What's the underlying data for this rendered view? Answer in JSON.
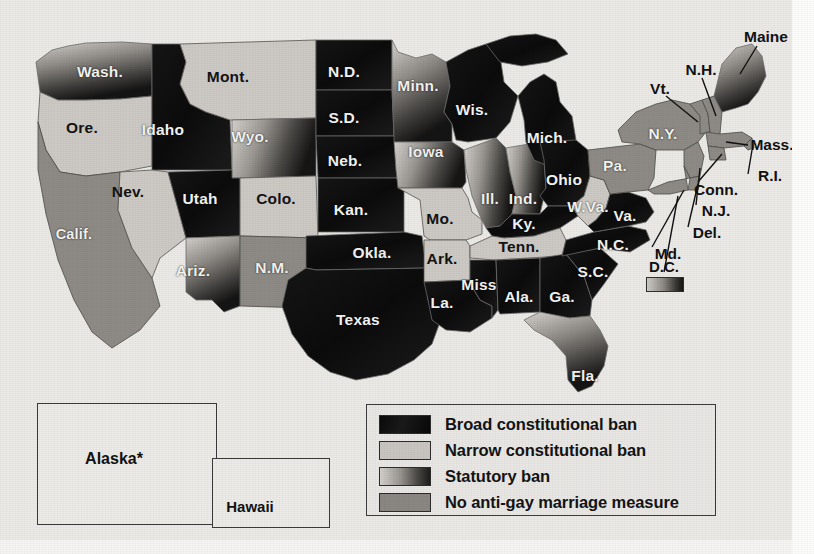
{
  "figure": {
    "kind": "choropleth-map"
  },
  "background_color": "#eceae7",
  "categories": [
    {
      "key": "broad",
      "label": "Broad constitutional ban",
      "swatch": "#0d0d0d",
      "style": "solid-dark"
    },
    {
      "key": "narrow",
      "label": "Narrow constitutional ban",
      "swatch": "#cdcac5",
      "style": "solid-light"
    },
    {
      "key": "stat",
      "label": "Statutory ban",
      "swatch": "#9a9792",
      "style": "gradient"
    },
    {
      "key": "none",
      "label": "No anti-gay marriage measure",
      "swatch": "#8e8b86",
      "style": "solid-medium"
    }
  ],
  "legend": {
    "name": "map-legend",
    "items": [
      "Broad constitutional ban",
      "Narrow constitutional ban",
      "Statutory ban",
      "No anti-gay marriage measure"
    ]
  },
  "insets": [
    {
      "name": "alaska-inset",
      "label": "Alaska*",
      "category": "none"
    },
    {
      "name": "hawaii-inset",
      "label": "Hawaii",
      "category": "broad"
    }
  ],
  "dc": {
    "label": "D.C.",
    "category": "stat"
  },
  "states": [
    {
      "abbr": "Wash.",
      "category": "stat",
      "x": 100,
      "y": 72,
      "tone": "lt"
    },
    {
      "abbr": "Ore.",
      "category": "narrow",
      "x": 82,
      "y": 128,
      "tone": "dk"
    },
    {
      "abbr": "Calif.",
      "category": "none",
      "x": 74,
      "y": 234,
      "tone": "lt"
    },
    {
      "abbr": "Idaho",
      "category": "broad",
      "x": 163,
      "y": 130,
      "tone": "lt"
    },
    {
      "abbr": "Nev.",
      "category": "narrow",
      "x": 128,
      "y": 192,
      "tone": "dk"
    },
    {
      "abbr": "Mont.",
      "category": "narrow",
      "x": 228,
      "y": 77,
      "tone": "dk"
    },
    {
      "abbr": "Wyo.",
      "category": "stat",
      "x": 250,
      "y": 137,
      "tone": "lt"
    },
    {
      "abbr": "Utah",
      "category": "broad",
      "x": 200,
      "y": 199,
      "tone": "lt"
    },
    {
      "abbr": "Colo.",
      "category": "narrow",
      "x": 276,
      "y": 199,
      "tone": "dk"
    },
    {
      "abbr": "Ariz.",
      "category": "stat",
      "x": 193,
      "y": 271,
      "tone": "lt"
    },
    {
      "abbr": "N.M.",
      "category": "none",
      "x": 272,
      "y": 268,
      "tone": "lt"
    },
    {
      "abbr": "N.D.",
      "category": "broad",
      "x": 344,
      "y": 72,
      "tone": "lt"
    },
    {
      "abbr": "S.D.",
      "category": "broad",
      "x": 344,
      "y": 118,
      "tone": "lt"
    },
    {
      "abbr": "Neb.",
      "category": "broad",
      "x": 345,
      "y": 161,
      "tone": "lt"
    },
    {
      "abbr": "Kan.",
      "category": "broad",
      "x": 351,
      "y": 210,
      "tone": "lt"
    },
    {
      "abbr": "Okla.",
      "category": "broad",
      "x": 372,
      "y": 253,
      "tone": "lt"
    },
    {
      "abbr": "Texas",
      "category": "broad",
      "x": 358,
      "y": 320,
      "tone": "lt"
    },
    {
      "abbr": "Minn.",
      "category": "stat",
      "x": 418,
      "y": 86,
      "tone": "lt"
    },
    {
      "abbr": "Iowa",
      "category": "stat",
      "x": 426,
      "y": 152,
      "tone": "lt"
    },
    {
      "abbr": "Mo.",
      "category": "narrow",
      "x": 440,
      "y": 219,
      "tone": "dk"
    },
    {
      "abbr": "Ark.",
      "category": "narrow",
      "x": 442,
      "y": 259,
      "tone": "dk"
    },
    {
      "abbr": "La.",
      "category": "broad",
      "x": 442,
      "y": 303,
      "tone": "lt"
    },
    {
      "abbr": "Wis.",
      "category": "broad",
      "x": 472,
      "y": 110,
      "tone": "lt"
    },
    {
      "abbr": "Ill.",
      "category": "stat",
      "x": 490,
      "y": 199,
      "tone": "lt"
    },
    {
      "abbr": "Ind.",
      "category": "stat",
      "x": 523,
      "y": 199,
      "tone": "lt"
    },
    {
      "abbr": "Mich.",
      "category": "broad",
      "x": 547,
      "y": 138,
      "tone": "lt"
    },
    {
      "abbr": "Ohio",
      "category": "broad",
      "x": 564,
      "y": 180,
      "tone": "lt"
    },
    {
      "abbr": "Ky.",
      "category": "broad",
      "x": 524,
      "y": 224,
      "tone": "lt"
    },
    {
      "abbr": "Tenn.",
      "category": "narrow",
      "x": 519,
      "y": 247,
      "tone": "dk"
    },
    {
      "abbr": "Miss",
      "category": "broad",
      "x": 479,
      "y": 285,
      "tone": "lt"
    },
    {
      "abbr": "Ala.",
      "category": "broad",
      "x": 519,
      "y": 297,
      "tone": "lt"
    },
    {
      "abbr": "Ga.",
      "category": "broad",
      "x": 562,
      "y": 297,
      "tone": "lt"
    },
    {
      "abbr": "Fla.",
      "category": "stat",
      "x": 585,
      "y": 376,
      "tone": "lt"
    },
    {
      "abbr": "S.C.",
      "category": "broad",
      "x": 593,
      "y": 272,
      "tone": "lt"
    },
    {
      "abbr": "N.C.",
      "category": "broad",
      "x": 613,
      "y": 245,
      "tone": "lt"
    },
    {
      "abbr": "W.Va.",
      "category": "narrow",
      "x": 588,
      "y": 207,
      "tone": "lt"
    },
    {
      "abbr": "Va.",
      "category": "broad",
      "x": 625,
      "y": 216,
      "tone": "lt"
    },
    {
      "abbr": "Pa.",
      "category": "none",
      "x": 615,
      "y": 166,
      "tone": "lt"
    },
    {
      "abbr": "N.Y.",
      "category": "none",
      "x": 663,
      "y": 134,
      "tone": "lt"
    }
  ],
  "callouts": [
    {
      "abbr": "Maine",
      "category": "stat",
      "x": 766,
      "y": 37
    },
    {
      "abbr": "N.H.",
      "category": "none",
      "x": 701,
      "y": 70
    },
    {
      "abbr": "Vt.",
      "category": "none",
      "x": 660,
      "y": 89
    },
    {
      "abbr": "Mass.",
      "category": "none",
      "x": 772,
      "y": 145
    },
    {
      "abbr": "R.I.",
      "category": "none",
      "x": 770,
      "y": 176
    },
    {
      "abbr": "Conn.",
      "category": "none",
      "x": 716,
      "y": 190
    },
    {
      "abbr": "N.J.",
      "category": "none",
      "x": 716,
      "y": 211
    },
    {
      "abbr": "Del.",
      "category": "none",
      "x": 707,
      "y": 233
    },
    {
      "abbr": "Md.",
      "category": "none",
      "x": 668,
      "y": 254
    }
  ]
}
